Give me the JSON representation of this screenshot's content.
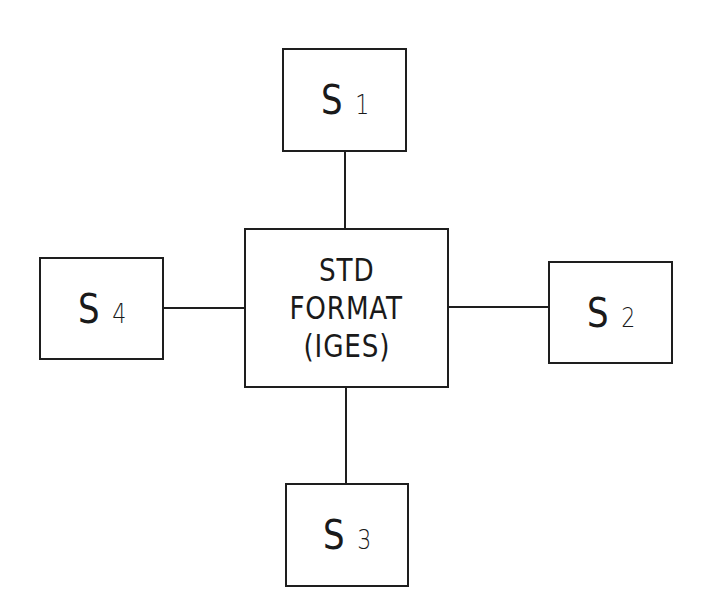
{
  "diagram": {
    "type": "hub-and-spoke",
    "center": {
      "lines": [
        "STD",
        "FORMAT",
        "(IGES)"
      ]
    },
    "systems": [
      {
        "id": "s1",
        "letter": "S",
        "number": "1",
        "position": "top"
      },
      {
        "id": "s2",
        "letter": "S",
        "number": "2",
        "position": "right"
      },
      {
        "id": "s3",
        "letter": "S",
        "number": "3",
        "position": "bottom"
      },
      {
        "id": "s4",
        "letter": "S",
        "number": "4",
        "position": "left"
      }
    ],
    "connections": [
      {
        "from": "s1",
        "to": "center"
      },
      {
        "from": "s2",
        "to": "center"
      },
      {
        "from": "s3",
        "to": "center"
      },
      {
        "from": "s4",
        "to": "center"
      }
    ],
    "colors": {
      "stroke": "#1e1e1e",
      "background": "#ffffff"
    }
  }
}
